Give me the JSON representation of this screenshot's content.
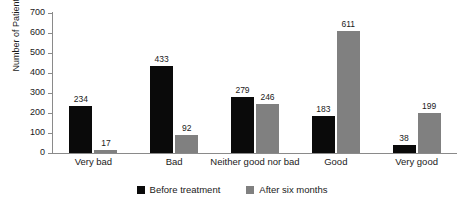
{
  "chart_data": {
    "type": "bar",
    "title": "",
    "xlabel": "",
    "ylabel": "Number of Patients",
    "ylim": [
      0,
      700
    ],
    "ytick_step": 100,
    "yticks": [
      700,
      600,
      500,
      400,
      300,
      200,
      100,
      0
    ],
    "grid": false,
    "legend_position": "bottom-center",
    "categories": [
      "Very bad",
      "Bad",
      "Neither good nor bad",
      "Good",
      "Very good"
    ],
    "series": [
      {
        "name": "Before treatment",
        "color": "#0a0a0a",
        "values": [
          234,
          433,
          279,
          183,
          38
        ]
      },
      {
        "name": "After six months",
        "color": "#808080",
        "values": [
          17,
          92,
          246,
          611,
          199
        ]
      }
    ],
    "data_labels": true
  },
  "axis": {
    "y_title": "Number of Patients",
    "line_color": "#8a8a8a"
  },
  "legend": {
    "items": [
      {
        "label": "Before treatment",
        "swatch": "legend-swatch-black"
      },
      {
        "label": "After six months",
        "swatch": "legend-swatch-gray"
      }
    ]
  }
}
